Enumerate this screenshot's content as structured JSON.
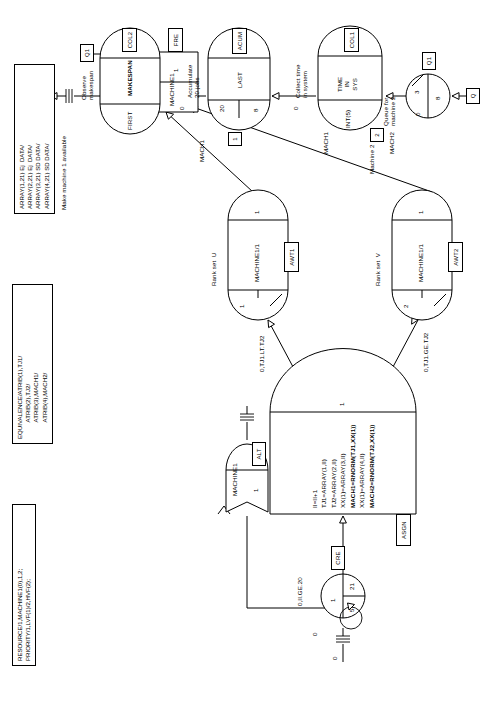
{
  "diagram": {
    "type": "slam-network-diagram",
    "orientation": "rotated-90-clockwise"
  },
  "codeblocks": [
    {
      "name": "resource-block",
      "text": "RESOURCE/1,MACHINE1(0),1,2;\nPRIORITY/1,LVF(1)/2,HVF(2);"
    },
    {
      "name": "equivalence-block",
      "text": "EQUIVALENCE/ATRIB(1),TJ1/\n          ATRIB(2),TJ2/\n          ATRIB(3),MACH1/\n          ATRIB(4),MACH2/"
    },
    {
      "name": "array-block",
      "text": "ARRAY(1,21) Ej  DATA/\nARRAY(2,21) Ej  DATA/\nARRAY(3,21) SD DATA/\nARRAY(4,21) SD DATA/"
    }
  ],
  "comments": {
    "make_machine_available": "Make machine 1 available",
    "free_machine1": "Free\nmachine 1",
    "rank_set_u": "Rank set  U",
    "rank_set_v": "Rank set  V",
    "observe_makespan": "Observe\nmakespan",
    "accumulate_jobs": "Accumulate\n20 jobs",
    "collect_time": "Collect time\nin system",
    "machine2": "Machine 2",
    "queue_machine2": "Queue for\nmachine 2"
  },
  "nodes": {
    "create": {
      "name": "create-node",
      "label": "CRE",
      "time_between": "1",
      "first_time": "0",
      "mark_attr": "5",
      "max_branches": "21",
      "offset": "0"
    },
    "assign": {
      "name": "assign-node",
      "label": "ASGN",
      "branches": "1",
      "statements": [
        "II=II+1",
        "TJ1=ARRAY(1,II)",
        "TJ2=ARRAY(2,II)",
        "XX(1)=ARRAY(3,II)",
        "MACH1=RNORM(TJ1,XX(1))",
        "XX(1)=ARRAY(4,II)",
        "MACH2=RNORM(TJ2,XX(1))"
      ]
    },
    "alter": {
      "name": "alter-node",
      "label": "ALT",
      "resource": "MACHINE1",
      "capacity_change": "1"
    },
    "await1": {
      "name": "await-node-1",
      "label": "AWT1",
      "resource": "MACHINE1/1",
      "queue_priority": "1",
      "branches": "1",
      "condition": "0,TJ1.LT.TJ2"
    },
    "await2": {
      "name": "await-node-2",
      "label": "AWT2",
      "resource": "MACHINE1/1",
      "queue_priority": "2",
      "branches": "1",
      "condition": "0,TJ1.GE.TJ2"
    },
    "free": {
      "name": "free-node",
      "label": "FRE",
      "resource": "MACHINE1",
      "units": "1"
    },
    "queue": {
      "name": "queue-node",
      "label": "Q1",
      "initial": "0",
      "capacity": "3",
      "max": "8",
      "gate_tag": "Q"
    },
    "colct": {
      "name": "colct-node",
      "label": "COL1",
      "stat_type": "INT(5)",
      "stat_label": "TIME\nIN\nSYS"
    },
    "accum": {
      "name": "accumulate-node",
      "label": "ACUM",
      "first_release": "20",
      "subsequent_release": "8",
      "save_criterion": "LAST"
    },
    "colct2": {
      "name": "colct-node-2",
      "label": "COL2",
      "stat_type": "FIRST",
      "stat_label": "MAKESPAN"
    }
  },
  "activities": [
    {
      "name": "activity-mach1-upper",
      "label": "MACH1",
      "tag": "1"
    },
    {
      "name": "activity-mach1-lower",
      "label": "MACH1",
      "tag": "1"
    },
    {
      "name": "activity-mach2",
      "label": "MACH2",
      "tag": "2"
    },
    {
      "name": "activity-q1",
      "label": "Q1",
      "tag": "Q1"
    },
    {
      "name": "activity-free-q1",
      "label": "Q1",
      "tag": "Q1"
    },
    {
      "name": "activity-zero-a",
      "label": "0"
    },
    {
      "name": "activity-zero-b",
      "label": "0"
    },
    {
      "name": "activity-zero-c",
      "label": "0"
    },
    {
      "name": "activity-zero-d",
      "label": "0"
    }
  ],
  "branch_conditions": {
    "left": "0,TJ1.LT.TJ2",
    "right": "0,TJ1.GE.TJ2",
    "create_out": "0,II.GE.20"
  }
}
